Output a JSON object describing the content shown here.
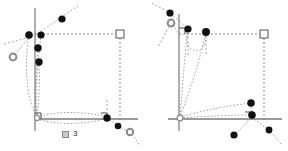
{
  "page": {
    "background_color": "#ffffff",
    "width": 288,
    "height": 151
  },
  "style_tokens": {
    "axis_color": "#7a7a7a",
    "dashed_color": "#8c8c8c",
    "dotted_color": "#9a9a9a",
    "filled_point_color": "#111111",
    "open_point_stroke": "#8a8a8a",
    "square_marker_stroke": "#6e6e6e",
    "right_angle_color": "#4a4a4a",
    "caption_color": "#2b2b2b"
  },
  "figures": [
    {
      "id": "figure-3",
      "caption": {
        "glyph_name": "missing-glyph-box",
        "number": "3"
      },
      "origin": {
        "x": 35,
        "y": 119
      },
      "axes": {
        "vertical": {
          "x": 35,
          "y_top": 8,
          "y_bottom": 131
        },
        "horizontal": {
          "y": 119,
          "x_left": 35,
          "x_right": 138
        }
      },
      "box": {
        "note": "dashed rectangle from origin to top-right square",
        "left": 35,
        "right": 120,
        "top": 34,
        "bottom": 119
      },
      "markers": {
        "square_open": [
          {
            "x": 120,
            "y": 34
          }
        ],
        "origin_open_circle": [
          {
            "x": 37,
            "y": 118
          }
        ],
        "open_circles": [
          {
            "x": 13,
            "y": 57
          },
          {
            "x": 130,
            "y": 132
          }
        ],
        "filled_points": [
          {
            "x": 62,
            "y": 19
          },
          {
            "x": 29,
            "y": 35
          },
          {
            "x": 41,
            "y": 35
          },
          {
            "x": 38,
            "y": 48
          },
          {
            "x": 39,
            "y": 62
          },
          {
            "x": 107,
            "y": 118
          },
          {
            "x": 118,
            "y": 126
          }
        ],
        "right_angles": [
          {
            "x": 35,
            "y": 119,
            "facing": "up-right"
          },
          {
            "x": 107,
            "y": 118,
            "facing": "up-right"
          }
        ]
      }
    },
    {
      "id": "figure-4",
      "caption": {
        "glyph_name": "missing-glyph-box",
        "number": "4"
      },
      "origin": {
        "x": 35,
        "y": 119
      },
      "axes": {
        "vertical": {
          "x": 35,
          "y_top": 14,
          "y_bottom": 131
        },
        "horizontal": {
          "y": 119,
          "x_left": 24,
          "x_right": 138
        }
      },
      "box": {
        "note": "dashed rectangle from origin to top-right square",
        "left": 35,
        "right": 120,
        "top": 34,
        "bottom": 119
      },
      "markers": {
        "square_open": [
          {
            "x": 120,
            "y": 34
          }
        ],
        "origin_open_circle": [
          {
            "x": 36,
            "y": 118
          }
        ],
        "open_circles": [
          {
            "x": 27,
            "y": 23
          }
        ],
        "filled_points": [
          {
            "x": 26,
            "y": 13
          },
          {
            "x": 44,
            "y": 29
          },
          {
            "x": 62,
            "y": 32
          },
          {
            "x": 107,
            "y": 103
          },
          {
            "x": 108,
            "y": 115
          },
          {
            "x": 90,
            "y": 135
          },
          {
            "x": 125,
            "y": 130
          }
        ],
        "right_angles": [
          {
            "x": 35,
            "y": 34,
            "facing": "down-right"
          },
          {
            "x": 107,
            "y": 119,
            "facing": "up-right"
          }
        ]
      }
    }
  ]
}
